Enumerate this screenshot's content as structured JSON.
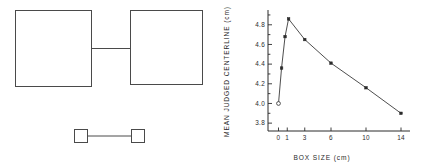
{
  "figure": {
    "panels": [
      "stimulus-diagram",
      "results-chart"
    ]
  },
  "stimulus": {
    "caption": "",
    "large_pair": {
      "name": "large-boxes-pair",
      "box_size_label": "large",
      "left_box": {
        "x": 15,
        "y": 10,
        "w": 76,
        "h": 76
      },
      "right_box": {
        "x": 130,
        "y": 10,
        "w": 72,
        "h": 74
      },
      "connector": {
        "x1": 91,
        "y1": 48,
        "x2": 130,
        "y2": 48
      }
    },
    "small_pair": {
      "name": "small-boxes-pair",
      "box_size_label": "small",
      "left_box": {
        "x": 74,
        "y": 129,
        "w": 13,
        "h": 13
      },
      "right_box": {
        "x": 131,
        "y": 129,
        "w": 13,
        "h": 13
      },
      "connector": {
        "x1": 87,
        "y1": 135.5,
        "x2": 131,
        "y2": 135.5
      }
    }
  },
  "chart_data": {
    "type": "line",
    "title": "",
    "xlabel": "BOX  SIZE   (cm)",
    "ylabel": "MEAN  JUDGED  CENTERLINE   (cm)",
    "xlim": [
      -1.2,
      14.8
    ],
    "ylim": [
      3.72,
      4.93
    ],
    "xticks": [
      0,
      1,
      3,
      6,
      10,
      14
    ],
    "xticklabels": [
      "0",
      "1",
      "3",
      "6",
      "10",
      "14"
    ],
    "yticks": [
      3.8,
      4.0,
      4.2,
      4.4,
      4.6,
      4.8
    ],
    "yticklabels": [
      "3.8",
      "4.0",
      "4.2",
      "4.4",
      "4.6",
      "4.8"
    ],
    "y_minor_ticks": [
      3.9,
      4.1,
      4.3,
      4.5,
      4.7,
      4.9
    ],
    "grid": false,
    "legend": null,
    "series": [
      {
        "name": "mean judged centerline",
        "x": [
          0,
          0.35,
          0.75,
          1.15,
          3,
          6,
          10,
          14
        ],
        "values": [
          4.0,
          4.36,
          4.68,
          4.86,
          4.65,
          4.41,
          4.16,
          3.9
        ],
        "markers": [
          "open",
          "filled",
          "filled",
          "filled",
          "filled",
          "filled",
          "filled",
          "filled"
        ]
      }
    ]
  },
  "axis_labels": {
    "x_title": "BOX  SIZE   (cm)",
    "y_title": "MEAN  JUDGED  CENTERLINE   (cm)"
  }
}
